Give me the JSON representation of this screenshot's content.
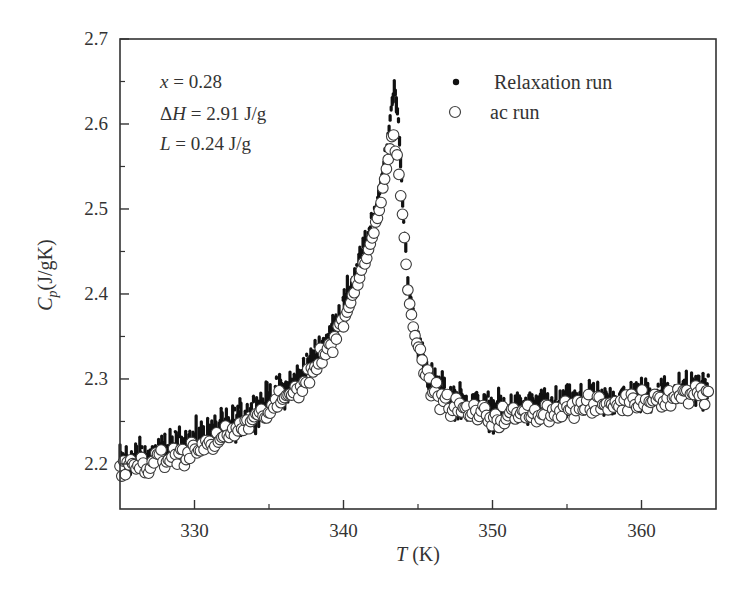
{
  "chart_data": {
    "type": "scatter",
    "title": "",
    "xlabel": "T (K)",
    "xlabel_parts": {
      "symbol": "T",
      "unit": " (K)"
    },
    "ylabel": "Cp (J/gK)",
    "ylabel_parts": {
      "symbol": "C",
      "sub": "p",
      "unit": "(J/gK)"
    },
    "xlim": [
      325,
      365
    ],
    "ylim": [
      2.147,
      2.7
    ],
    "x_ticks": [
      330,
      340,
      350,
      360
    ],
    "x_minor_ticks": [
      335,
      345,
      355
    ],
    "y_ticks": [
      2.2,
      2.3,
      2.4,
      2.5,
      2.6,
      2.7
    ],
    "y_tick_labels": [
      "2.2",
      "2.3",
      "2.4",
      "2.5",
      "2.6",
      "2.7"
    ],
    "y_minor_ticks": [
      2.25,
      2.35,
      2.45,
      2.55,
      2.65
    ],
    "grid": false,
    "legend_position": "upper right",
    "annotations": [
      {
        "symbol": "x",
        "text": " = 0.28"
      },
      {
        "symbol": "ΔH",
        "text": " = 2.91 J/g"
      },
      {
        "symbol": "L",
        "text": " = 0.24 J/g"
      }
    ],
    "series": [
      {
        "name": "Relaxation run",
        "marker": "filled-dot",
        "color": "#111111",
        "noise": 0.018,
        "step": 0.07,
        "x": [
          325,
          327,
          330,
          332,
          335,
          337,
          338,
          339,
          340,
          341,
          342,
          342.5,
          343,
          343.4,
          343.7,
          344,
          344.3,
          344.7,
          345.2,
          346,
          347,
          348,
          350,
          352,
          355,
          358,
          360,
          362,
          364.5
        ],
        "values": [
          2.205,
          2.21,
          2.228,
          2.242,
          2.275,
          2.3,
          2.325,
          2.35,
          2.385,
          2.43,
          2.49,
          2.53,
          2.59,
          2.645,
          2.6,
          2.5,
          2.42,
          2.37,
          2.33,
          2.295,
          2.28,
          2.272,
          2.262,
          2.265,
          2.27,
          2.275,
          2.28,
          2.285,
          2.29
        ]
      },
      {
        "name": "ac run",
        "marker": "open-circle",
        "color": "#333333",
        "noise": 0.01,
        "step": 0.12,
        "x": [
          325,
          327,
          330,
          332,
          335,
          337,
          338,
          339,
          340,
          341,
          342,
          342.5,
          343,
          343.3,
          343.6,
          344,
          344.3,
          344.7,
          345.2,
          346,
          347,
          348,
          350,
          352,
          355,
          358,
          360,
          362,
          364.5
        ],
        "values": [
          2.195,
          2.2,
          2.215,
          2.232,
          2.262,
          2.29,
          2.312,
          2.335,
          2.37,
          2.415,
          2.47,
          2.51,
          2.56,
          2.59,
          2.56,
          2.49,
          2.41,
          2.36,
          2.32,
          2.287,
          2.27,
          2.263,
          2.255,
          2.258,
          2.265,
          2.27,
          2.275,
          2.28,
          2.285
        ]
      }
    ]
  }
}
